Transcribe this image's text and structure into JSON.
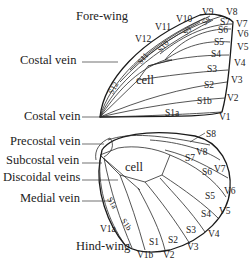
{
  "forewing": {
    "title": "Fore-wing",
    "left_labels": [
      "Costal vein",
      "Costal vein"
    ],
    "cell": "cell",
    "veins": [
      "V1",
      "V2",
      "V3",
      "V4",
      "V5",
      "V6",
      "V7",
      "V8",
      "V9",
      "V10",
      "V11",
      "V12"
    ],
    "spaces": [
      "S1a",
      "S1b",
      "S2",
      "S3",
      "S4",
      "S5",
      "S6",
      "S7",
      "S8",
      "S9",
      "S10",
      "S11",
      "S12"
    ]
  },
  "hindwing": {
    "title": "Hind-wing",
    "left_labels": [
      "Precostal vein",
      "Subcostal vein",
      "Discoidal veins",
      "Medial vein"
    ],
    "cell": "cell",
    "veins": [
      "V1a",
      "V1b",
      "V2",
      "V3",
      "V4",
      "V5",
      "V6",
      "V7",
      "V8"
    ],
    "spaces": [
      "S1a",
      "S1b",
      "S1",
      "S2",
      "S3",
      "S4",
      "S5",
      "S6",
      "S7",
      "S8"
    ]
  }
}
